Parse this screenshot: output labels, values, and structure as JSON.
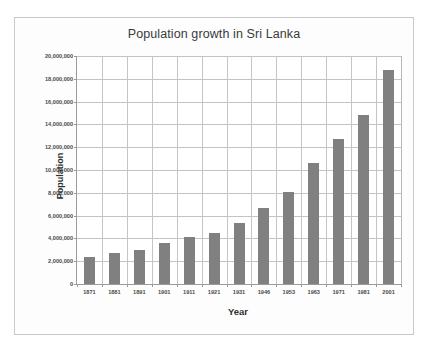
{
  "chart_data": {
    "type": "bar",
    "title": "Population growth in Sri Lanka",
    "xlabel": "Year",
    "ylabel": "Population",
    "categories": [
      "1871",
      "1881",
      "1891",
      "1901",
      "1911",
      "1921",
      "1931",
      "1946",
      "1953",
      "1963",
      "1971",
      "1981",
      "2001"
    ],
    "values": [
      2400000,
      2760000,
      3010000,
      3570000,
      4110000,
      4500000,
      5310000,
      6660000,
      8100000,
      10580000,
      12690000,
      14850000,
      18730000
    ],
    "ylim": [
      0,
      20000000
    ],
    "ytick_values": [
      0,
      2000000,
      4000000,
      6000000,
      8000000,
      10000000,
      12000000,
      14000000,
      16000000,
      18000000,
      20000000
    ],
    "ytick_labels": [
      "0",
      "2,000,000",
      "4,000,000",
      "6,000,000",
      "8,000,000",
      "10,000,000",
      "12,000,000",
      "14,000,000",
      "16,000,000",
      "18,000,000",
      "20,000,000"
    ],
    "grid": {
      "horizontal": true,
      "vertical": true
    },
    "legend": null,
    "series_color": "#808080",
    "gridline_color": "#c4c4c4",
    "axis_color": "#9a9a9a",
    "plot_background": "#ffffff",
    "frame_background": "#fdfdfd"
  }
}
